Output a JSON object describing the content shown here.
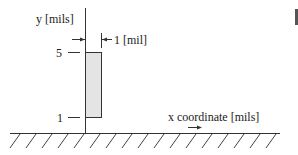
{
  "diagram": {
    "y_axis_label": "y [mils]",
    "x_axis_label": "x coordinate [mils]",
    "dimension_label": "1 [mil]",
    "ticks": [
      {
        "label": "5",
        "value": 5
      },
      {
        "label": "1",
        "value": 1
      }
    ],
    "rectangle": {
      "width_mils": 1,
      "y_bottom": 1,
      "y_top": 5,
      "fill": "#e4e4e4",
      "stroke": "#333333"
    },
    "ground": {
      "hatched": true
    }
  },
  "colors": {
    "line": "#333333",
    "fill": "#e4e4e4",
    "background": "#ffffff"
  }
}
